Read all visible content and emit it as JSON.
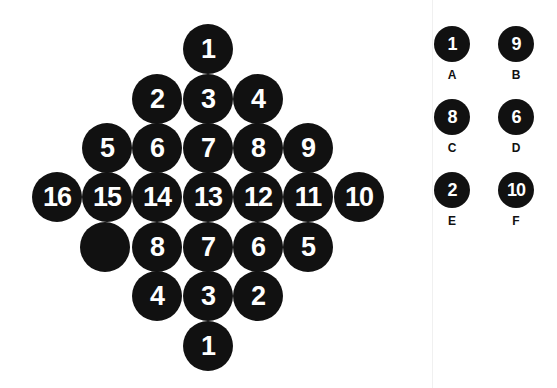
{
  "puzzle": {
    "rows": [
      [
        "1"
      ],
      [
        "2",
        "3",
        "4"
      ],
      [
        "5",
        "6",
        "7",
        "8",
        "9"
      ],
      [
        "16",
        "15",
        "14",
        "13",
        "12",
        "11",
        "10"
      ],
      [
        "",
        "8",
        "7",
        "6",
        "5"
      ],
      [
        "4",
        "3",
        "2"
      ],
      [
        "1"
      ]
    ],
    "missing_position": "row 5, first circle (blank)"
  },
  "options": [
    {
      "label": "A",
      "value": "1"
    },
    {
      "label": "B",
      "value": "9"
    },
    {
      "label": "C",
      "value": "8"
    },
    {
      "label": "D",
      "value": "6"
    },
    {
      "label": "E",
      "value": "2"
    },
    {
      "label": "F",
      "value": "10"
    }
  ],
  "colors": {
    "circle": "#111111",
    "text": "#ffffff",
    "background": "#ffffff"
  }
}
